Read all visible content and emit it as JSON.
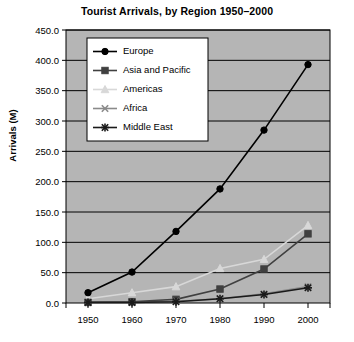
{
  "chart_data": {
    "type": "line",
    "title": "Tourist Arrivals, by Region 1950–2000",
    "xlabel": "",
    "ylabel": "Arrivals (M)",
    "x": [
      1950,
      1960,
      1970,
      1980,
      1990,
      2000
    ],
    "xtick_labels": [
      "1950",
      "1960",
      "1970",
      "1980",
      "1990",
      "2000"
    ],
    "ytick_labels": [
      "0.0",
      "50.0",
      "100.0",
      "150.0",
      "200.0",
      "250.0",
      "300.0",
      "350.0",
      "400.0",
      "450.0"
    ],
    "ytick_values": [
      0,
      50,
      100,
      150,
      200,
      250,
      300,
      350,
      400,
      450
    ],
    "ylim": [
      0,
      450
    ],
    "grid": "horizontal",
    "legend_position": "top-left-inside",
    "plot_background": "#b5b5b5",
    "series": [
      {
        "name": "Europe",
        "marker": "filled-circle",
        "color": "#000000",
        "values": [
          17,
          51,
          118,
          188,
          285,
          393
        ]
      },
      {
        "name": "Asia and Pacific",
        "marker": "filled-square",
        "color": "#404040",
        "values": [
          1,
          2,
          6,
          23,
          56,
          114
        ]
      },
      {
        "name": "Americas",
        "marker": "filled-triangle",
        "color": "#d8d8d8",
        "values": [
          7,
          17,
          27,
          57,
          72,
          128
        ]
      },
      {
        "name": "Africa",
        "marker": "cross-x",
        "color": "#8a8a8a",
        "values": [
          1,
          1,
          3,
          7,
          15,
          27
        ]
      },
      {
        "name": "Middle East",
        "marker": "asterisk",
        "color": "#1a1a1a",
        "values": [
          1,
          1,
          2,
          7,
          14,
          25
        ]
      }
    ]
  }
}
